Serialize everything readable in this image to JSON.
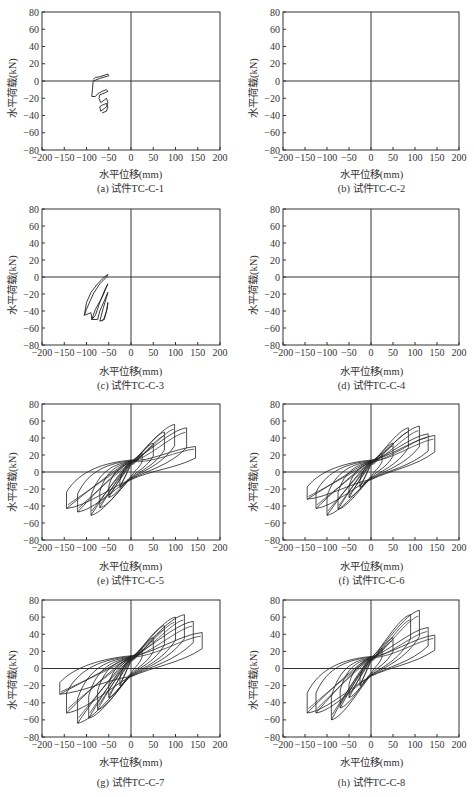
{
  "chart_data": [
    {
      "id": "a",
      "type": "line",
      "title": "(a) 试件TC-C-1",
      "xlabel": "水平位移(mm)",
      "ylabel": "水平荷载(kN)",
      "xlim": [
        -200,
        200
      ],
      "ylim": [
        -80,
        80
      ],
      "xticks": [
        -200,
        -150,
        -100,
        -50,
        0,
        50,
        100,
        150,
        200
      ],
      "yticks": [
        80,
        60,
        40,
        20,
        0,
        -20,
        -40,
        -60,
        -80
      ],
      "grid": false,
      "series": [
        {
          "name": "hysteresis",
          "points": [
            [
              -85,
              2
            ],
            [
              -80,
              4
            ],
            [
              -70,
              5
            ],
            [
              -52,
              8
            ],
            [
              -50,
              6
            ],
            [
              -70,
              3
            ],
            [
              -85,
              0
            ],
            [
              -88,
              -18
            ],
            [
              -80,
              -18
            ],
            [
              -75,
              -15
            ],
            [
              -65,
              -12
            ],
            [
              -55,
              -10
            ],
            [
              -52,
              -12
            ],
            [
              -60,
              -14
            ],
            [
              -70,
              -16
            ],
            [
              -72,
              -20
            ],
            [
              -68,
              -25
            ],
            [
              -60,
              -22
            ],
            [
              -55,
              -20
            ],
            [
              -52,
              -25
            ],
            [
              -55,
              -30
            ],
            [
              -60,
              -32
            ],
            [
              -68,
              -35
            ],
            [
              -70,
              -30
            ],
            [
              -65,
              -28
            ],
            [
              -55,
              -26
            ],
            [
              -52,
              -30
            ],
            [
              -55,
              -35
            ],
            [
              -65,
              -37
            ]
          ]
        }
      ]
    },
    {
      "id": "b",
      "type": "line",
      "title": "(b) 试件TC-C-2",
      "xlabel": "水平位移(mm)",
      "ylabel": "水平荷载(kN)",
      "xlim": [
        -200,
        200
      ],
      "ylim": [
        -80,
        80
      ],
      "xticks": [
        -200,
        -150,
        -100,
        -50,
        0,
        50,
        100,
        150,
        200
      ],
      "yticks": [
        80,
        60,
        40,
        20,
        0,
        -20,
        -40,
        -60,
        -80
      ],
      "grid": false,
      "series": []
    },
    {
      "id": "c",
      "type": "line",
      "title": "(c) 试件TC-C-3",
      "xlabel": "水平位移(mm)",
      "ylabel": "水平荷载(kN)",
      "xlim": [
        -200,
        200
      ],
      "ylim": [
        -80,
        80
      ],
      "xticks": [
        -200,
        -150,
        -100,
        -50,
        0,
        50,
        100,
        150,
        200
      ],
      "yticks": [
        80,
        60,
        40,
        20,
        0,
        -20,
        -40,
        -60,
        -80
      ],
      "grid": false,
      "series": [
        {
          "name": "hysteresis",
          "points": [
            [
              -105,
              -45
            ],
            [
              -100,
              -30
            ],
            [
              -90,
              -18
            ],
            [
              -75,
              -8
            ],
            [
              -60,
              0
            ],
            [
              -52,
              3
            ],
            [
              -55,
              0
            ],
            [
              -70,
              -8
            ],
            [
              -85,
              -20
            ],
            [
              -100,
              -38
            ],
            [
              -105,
              -45
            ],
            [
              -90,
              -42
            ],
            [
              -88,
              -50
            ],
            [
              -80,
              -45
            ],
            [
              -70,
              -30
            ],
            [
              -58,
              -14
            ],
            [
              -52,
              -8
            ],
            [
              -55,
              -12
            ],
            [
              -65,
              -24
            ],
            [
              -80,
              -38
            ],
            [
              -88,
              -50
            ],
            [
              -75,
              -50
            ],
            [
              -70,
              -40
            ],
            [
              -60,
              -28
            ],
            [
              -52,
              -18
            ],
            [
              -55,
              -24
            ],
            [
              -62,
              -36
            ],
            [
              -70,
              -52
            ],
            [
              -60,
              -50
            ],
            [
              -55,
              -40
            ],
            [
              -52,
              -30
            ],
            [
              -54,
              -38
            ],
            [
              -60,
              -48
            ],
            [
              -65,
              -52
            ]
          ]
        }
      ]
    },
    {
      "id": "d",
      "type": "line",
      "title": "(d) 试件TC-C-4",
      "xlabel": "水平位移(mm)",
      "ylabel": "水平荷载(kN)",
      "xlim": [
        -200,
        200
      ],
      "ylim": [
        -80,
        80
      ],
      "xticks": [
        -200,
        -150,
        -100,
        -50,
        0,
        50,
        100,
        150,
        200
      ],
      "yticks": [
        80,
        60,
        40,
        20,
        0,
        -20,
        -40,
        -60,
        -80
      ],
      "grid": false,
      "series": []
    },
    {
      "id": "e",
      "type": "line",
      "title": "(e) 试件TC-C-5",
      "xlabel": "水平位移(mm)",
      "ylabel": "水平荷载(kN)",
      "xlim": [
        -200,
        200
      ],
      "ylim": [
        -80,
        80
      ],
      "xticks": [
        -200,
        -150,
        -100,
        -50,
        0,
        50,
        100,
        150,
        200
      ],
      "yticks": [
        80,
        60,
        40,
        20,
        0,
        -20,
        -40,
        -60,
        -80
      ],
      "grid": false,
      "peak_positive": {
        "x": 98,
        "y": 56
      },
      "peak_negative": {
        "x": -90,
        "y": -51
      },
      "envelope_positive": [
        [
          0,
          12
        ],
        [
          25,
          22
        ],
        [
          50,
          34
        ],
        [
          75,
          47
        ],
        [
          98,
          56
        ],
        [
          125,
          52
        ],
        [
          145,
          30
        ]
      ],
      "envelope_negative": [
        [
          0,
          -8
        ],
        [
          -25,
          -18
        ],
        [
          -50,
          -30
        ],
        [
          -70,
          -42
        ],
        [
          -90,
          -51
        ],
        [
          -120,
          -47
        ],
        [
          -145,
          -43
        ]
      ],
      "loops": [
        {
          "amp_pos": 25,
          "peak_pos": 22,
          "amp_neg": -25,
          "peak_neg": -18
        },
        {
          "amp_pos": 50,
          "peak_pos": 34,
          "amp_neg": -50,
          "peak_neg": -30
        },
        {
          "amp_pos": 75,
          "peak_pos": 47,
          "amp_neg": -70,
          "peak_neg": -42
        },
        {
          "amp_pos": 98,
          "peak_pos": 56,
          "amp_neg": -90,
          "peak_neg": -51
        },
        {
          "amp_pos": 125,
          "peak_pos": 52,
          "amp_neg": -120,
          "peak_neg": -47
        },
        {
          "amp_pos": 145,
          "peak_pos": 30,
          "amp_neg": -145,
          "peak_neg": -43
        }
      ]
    },
    {
      "id": "f",
      "type": "line",
      "title": "(f) 试件TC-C-6",
      "xlabel": "水平位移(mm)",
      "ylabel": "水平荷载(kN)",
      "xlim": [
        -200,
        200
      ],
      "ylim": [
        -80,
        80
      ],
      "xticks": [
        -200,
        -150,
        -100,
        -50,
        0,
        50,
        100,
        150,
        200
      ],
      "yticks": [
        80,
        60,
        40,
        20,
        0,
        -20,
        -40,
        -60,
        -80
      ],
      "grid": false,
      "peak_positive": {
        "x": 110,
        "y": 54
      },
      "peak_negative": {
        "x": -100,
        "y": -51
      },
      "envelope_positive": [
        [
          0,
          13
        ],
        [
          25,
          22
        ],
        [
          50,
          34
        ],
        [
          85,
          52
        ],
        [
          110,
          54
        ],
        [
          130,
          45
        ],
        [
          145,
          43
        ]
      ],
      "envelope_negative": [
        [
          0,
          -7
        ],
        [
          -25,
          -18
        ],
        [
          -50,
          -30
        ],
        [
          -75,
          -44
        ],
        [
          -100,
          -51
        ],
        [
          -125,
          -43
        ],
        [
          -145,
          -32
        ]
      ],
      "loops": [
        {
          "amp_pos": 25,
          "peak_pos": 22,
          "amp_neg": -25,
          "peak_neg": -18
        },
        {
          "amp_pos": 50,
          "peak_pos": 34,
          "amp_neg": -50,
          "peak_neg": -30
        },
        {
          "amp_pos": 85,
          "peak_pos": 52,
          "amp_neg": -75,
          "peak_neg": -44
        },
        {
          "amp_pos": 110,
          "peak_pos": 54,
          "amp_neg": -100,
          "peak_neg": -51
        },
        {
          "amp_pos": 130,
          "peak_pos": 45,
          "amp_neg": -125,
          "peak_neg": -43
        },
        {
          "amp_pos": 145,
          "peak_pos": 43,
          "amp_neg": -145,
          "peak_neg": -32
        }
      ]
    },
    {
      "id": "g",
      "type": "line",
      "title": "(g) 试件TC-C-7",
      "xlabel": "水平位移(mm)",
      "ylabel": "水平荷载(kN)",
      "xlim": [
        -200,
        200
      ],
      "ylim": [
        -80,
        80
      ],
      "xticks": [
        -200,
        -150,
        -100,
        -50,
        0,
        50,
        100,
        150,
        200
      ],
      "yticks": [
        80,
        60,
        40,
        20,
        0,
        -20,
        -40,
        -60,
        -80
      ],
      "grid": false,
      "peak_positive": {
        "x": 120,
        "y": 63
      },
      "peak_negative": {
        "x": -120,
        "y": -64
      },
      "envelope_positive": [
        [
          0,
          15
        ],
        [
          25,
          24
        ],
        [
          50,
          36
        ],
        [
          75,
          50
        ],
        [
          100,
          60
        ],
        [
          120,
          63
        ],
        [
          140,
          55
        ],
        [
          160,
          42
        ]
      ],
      "envelope_negative": [
        [
          0,
          -8
        ],
        [
          -25,
          -20
        ],
        [
          -50,
          -34
        ],
        [
          -75,
          -48
        ],
        [
          -95,
          -58
        ],
        [
          -120,
          -64
        ],
        [
          -145,
          -52
        ],
        [
          -160,
          -30
        ]
      ],
      "loops": [
        {
          "amp_pos": 25,
          "peak_pos": 24,
          "amp_neg": -25,
          "peak_neg": -20
        },
        {
          "amp_pos": 50,
          "peak_pos": 36,
          "amp_neg": -50,
          "peak_neg": -34
        },
        {
          "amp_pos": 75,
          "peak_pos": 50,
          "amp_neg": -75,
          "peak_neg": -48
        },
        {
          "amp_pos": 100,
          "peak_pos": 60,
          "amp_neg": -95,
          "peak_neg": -58
        },
        {
          "amp_pos": 120,
          "peak_pos": 63,
          "amp_neg": -120,
          "peak_neg": -64
        },
        {
          "amp_pos": 140,
          "peak_pos": 55,
          "amp_neg": -145,
          "peak_neg": -52
        },
        {
          "amp_pos": 160,
          "peak_pos": 42,
          "amp_neg": -160,
          "peak_neg": -30
        }
      ]
    },
    {
      "id": "h",
      "type": "line",
      "title": "(h) 试件TC-C-8",
      "xlabel": "水平位移(mm)",
      "ylabel": "水平荷载(kN)",
      "xlim": [
        -200,
        200
      ],
      "ylim": [
        -80,
        80
      ],
      "xticks": [
        -200,
        -150,
        -100,
        -50,
        0,
        50,
        100,
        150,
        200
      ],
      "yticks": [
        80,
        60,
        40,
        20,
        0,
        -20,
        -40,
        -60,
        -80
      ],
      "grid": false,
      "peak_positive": {
        "x": 110,
        "y": 68
      },
      "peak_negative": {
        "x": -90,
        "y": -60
      },
      "envelope_positive": [
        [
          0,
          16
        ],
        [
          25,
          24
        ],
        [
          50,
          36
        ],
        [
          90,
          63
        ],
        [
          110,
          68
        ],
        [
          130,
          48
        ],
        [
          145,
          39
        ]
      ],
      "envelope_negative": [
        [
          0,
          -8
        ],
        [
          -25,
          -20
        ],
        [
          -50,
          -34
        ],
        [
          -70,
          -46
        ],
        [
          -90,
          -60
        ],
        [
          -125,
          -52
        ],
        [
          -145,
          -52
        ]
      ],
      "loops": [
        {
          "amp_pos": 25,
          "peak_pos": 24,
          "amp_neg": -25,
          "peak_neg": -20
        },
        {
          "amp_pos": 50,
          "peak_pos": 36,
          "amp_neg": -50,
          "peak_neg": -34
        },
        {
          "amp_pos": 90,
          "peak_pos": 63,
          "amp_neg": -70,
          "peak_neg": -46
        },
        {
          "amp_pos": 110,
          "peak_pos": 68,
          "amp_neg": -90,
          "peak_neg": -60
        },
        {
          "amp_pos": 130,
          "peak_pos": 48,
          "amp_neg": -125,
          "peak_neg": -52
        },
        {
          "amp_pos": 145,
          "peak_pos": 39,
          "amp_neg": -145,
          "peak_neg": -52
        }
      ]
    }
  ],
  "panels": {
    "a": {
      "caption": "(a) 试件TC-C-1",
      "xlabel": "水平位移(mm)",
      "ylabel": "水平荷载(kN)"
    },
    "b": {
      "caption": "(b) 试件TC-C-2",
      "xlabel": "水平位移(mm)",
      "ylabel": "水平荷载(kN)"
    },
    "c": {
      "caption": "(c) 试件TC-C-3",
      "xlabel": "水平位移(mm)",
      "ylabel": "水平荷载(kN)"
    },
    "d": {
      "caption": "(d) 试件TC-C-4",
      "xlabel": "水平位移(mm)",
      "ylabel": "水平荷载(kN)"
    },
    "e": {
      "caption": "(e) 试件TC-C-5",
      "xlabel": "水平位移(mm)",
      "ylabel": "水平荷载(kN)"
    },
    "f": {
      "caption": "(f) 试件TC-C-6",
      "xlabel": "水平位移(mm)",
      "ylabel": "水平荷载(kN)"
    },
    "g": {
      "caption": "(g) 试件TC-C-7",
      "xlabel": "水平位移(mm)",
      "ylabel": "水平荷载(kN)"
    },
    "h": {
      "caption": "(h) 试件TC-C-8",
      "xlabel": "水平位移(mm)",
      "ylabel": "水平荷载(kN)"
    }
  },
  "style": {
    "line_color": "#222222",
    "axis_color": "#333333",
    "background": "#ffffff"
  }
}
